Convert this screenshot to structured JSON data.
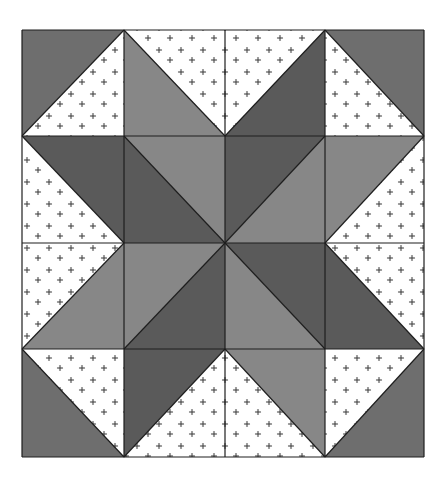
{
  "grid": {
    "x": [
      22,
      124,
      225,
      325,
      424
    ],
    "y": [
      30,
      136,
      243,
      349,
      457
    ]
  },
  "colors": {
    "background": "#ffffff",
    "corner": "#6e6e6e",
    "dark": "#5a5a5a",
    "medium": "#878787",
    "print": "#ffffff",
    "print_dot": "#8a8a8a",
    "seam": "#1e1e1e"
  },
  "tiles": [
    {
      "row": 0,
      "col": 0,
      "diag": "bl-tr",
      "a": "corner",
      "b": "print"
    },
    {
      "row": 0,
      "col": 1,
      "diag": "tl-br",
      "a": "print",
      "b": "medium"
    },
    {
      "row": 0,
      "col": 2,
      "diag": "bl-tr",
      "a": "print",
      "b": "dark"
    },
    {
      "row": 0,
      "col": 3,
      "diag": "tl-br",
      "a": "corner",
      "b": "print"
    },
    {
      "row": 1,
      "col": 0,
      "diag": "tl-br",
      "a": "dark",
      "b": "print"
    },
    {
      "row": 1,
      "col": 1,
      "diag": "tl-br",
      "a": "medium",
      "b": "dark"
    },
    {
      "row": 1,
      "col": 2,
      "diag": "bl-tr",
      "a": "dark",
      "b": "medium"
    },
    {
      "row": 1,
      "col": 3,
      "diag": "bl-tr",
      "a": "medium",
      "b": "print"
    },
    {
      "row": 2,
      "col": 0,
      "diag": "bl-tr",
      "a": "print",
      "b": "medium"
    },
    {
      "row": 2,
      "col": 1,
      "diag": "bl-tr",
      "a": "medium",
      "b": "dark"
    },
    {
      "row": 2,
      "col": 2,
      "diag": "tl-br",
      "a": "dark",
      "b": "medium"
    },
    {
      "row": 2,
      "col": 3,
      "diag": "tl-br",
      "a": "print",
      "b": "dark"
    },
    {
      "row": 3,
      "col": 0,
      "diag": "tl-br",
      "a": "print",
      "b": "corner"
    },
    {
      "row": 3,
      "col": 1,
      "diag": "bl-tr",
      "a": "dark",
      "b": "print"
    },
    {
      "row": 3,
      "col": 2,
      "diag": "tl-br",
      "a": "medium",
      "b": "print"
    },
    {
      "row": 3,
      "col": 3,
      "diag": "bl-tr",
      "a": "print",
      "b": "corner"
    }
  ],
  "legend_note": "diag tl-br: a = top-right triangle, b = bottom-left triangle; diag bl-tr: a = top-left triangle, b = bottom-right triangle"
}
